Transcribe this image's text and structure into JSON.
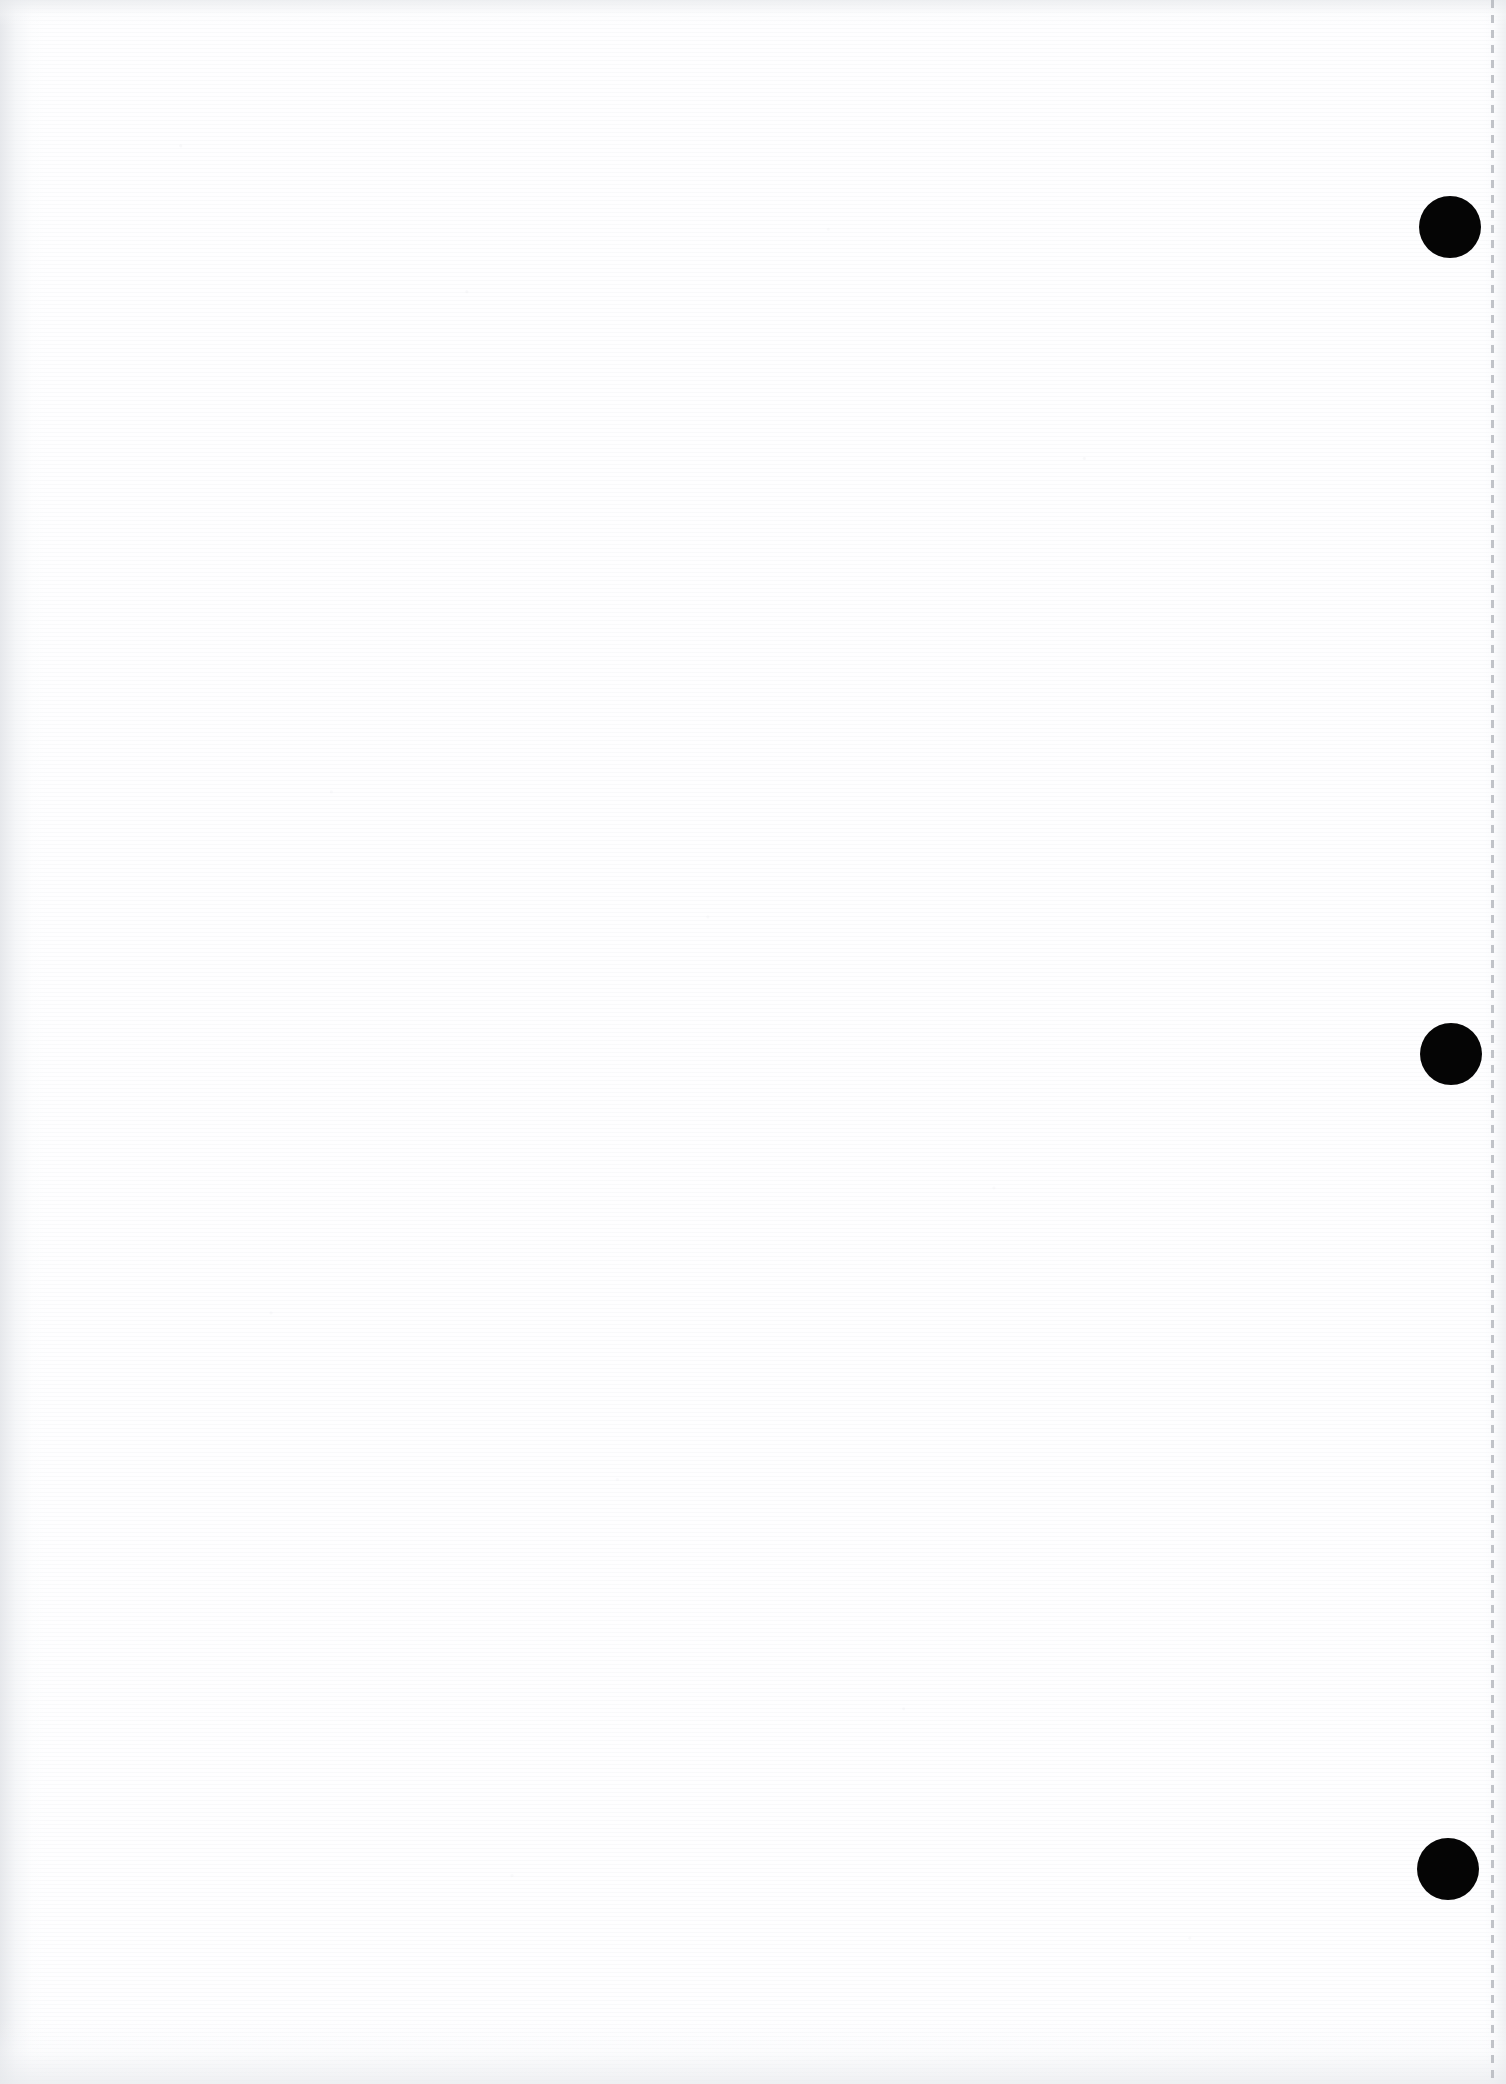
{
  "page": {
    "kind": "scanned-blank-page",
    "width": 1506,
    "height": 2084,
    "background_color": "#ffffff",
    "paper_tone_color": "#fefeff",
    "text_content": "",
    "body_text_present": false
  },
  "marks": {
    "ink_color": "#050505",
    "punch_marks": [
      {
        "label": "punch-mark-top",
        "cx": 1450,
        "cy": 227,
        "r": 31
      },
      {
        "label": "punch-mark-middle",
        "cx": 1451,
        "cy": 1054,
        "r": 31
      },
      {
        "label": "punch-mark-bottom",
        "cx": 1448,
        "cy": 1869,
        "r": 31
      }
    ]
  },
  "margin_rule": {
    "label": "right-margin-dashed-rule",
    "x": 1491,
    "width": 3,
    "color": "#b2b5bb",
    "dash_length": 8,
    "gap_length": 7
  },
  "shading": {
    "left_gutter_color": "#e2e4e8",
    "right_gutter_color": "#e9ebee",
    "top_edge_color": "#e7e9ec",
    "bottom_edge_color": "#e8eaed"
  },
  "icons": {
    "punch_mark": "filled-circle-icon",
    "margin_rule": "dashed-vertical-line-icon"
  }
}
